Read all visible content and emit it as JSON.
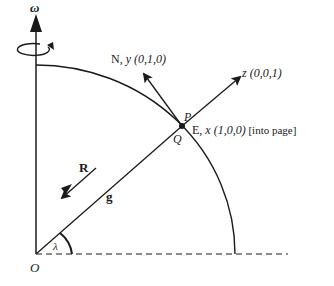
{
  "diagram": {
    "omega_label": "ω",
    "north_label": "N, ",
    "north_axis": "y",
    "north_coords": " (0,1,0)",
    "z_axis": "z",
    "z_coords": " (0,0,1)",
    "point_p": "P",
    "point_q": "Q",
    "east_label": "E, ",
    "east_axis": "x",
    "east_coords": " (1,0,0)",
    "east_note": " [into page]",
    "r_label": "R",
    "g_label": "g",
    "origin_label": "O",
    "angle_label": "λ",
    "colors": {
      "stroke": "#1a1a1a",
      "background": "#ffffff"
    }
  }
}
